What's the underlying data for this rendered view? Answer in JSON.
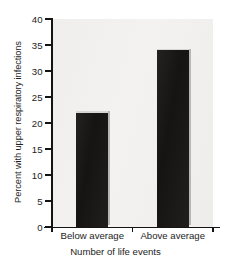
{
  "chart_data": {
    "type": "bar",
    "title": "",
    "categories": [
      "Below average",
      "Above average"
    ],
    "values": [
      22,
      34
    ],
    "xlabel": "Number of life events",
    "ylabel": "Percent with upper respiratory infections",
    "ylim": [
      0,
      40
    ],
    "ytick_labels": [
      "0",
      "5",
      "10",
      "15",
      "20",
      "25",
      "30",
      "35",
      "40"
    ],
    "ytick_values": [
      0,
      5,
      10,
      15,
      20,
      25,
      30,
      35,
      40
    ],
    "ytick_step": 5,
    "grid": false,
    "legend": false,
    "legend_position": "none",
    "bar_color": "#1b1a18",
    "plot_background": "#f1f0ee",
    "axis_color": "#141414"
  }
}
